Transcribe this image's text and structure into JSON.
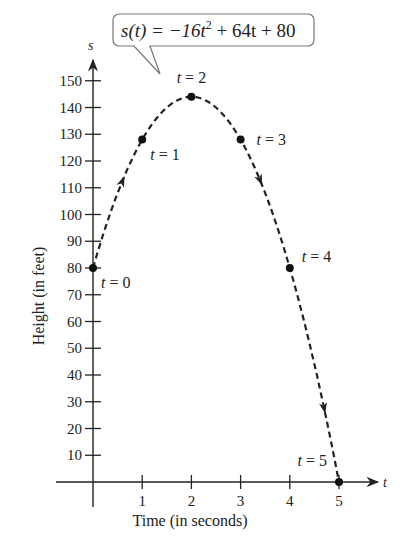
{
  "chart_data": {
    "type": "line",
    "title": "",
    "function_label": "s(t) = −16t² + 64t + 80",
    "xlabel": "Time (in seconds)",
    "ylabel": "Height (in feet)",
    "x_axis_var": "t",
    "y_axis_var": "s",
    "xlim": [
      0,
      5
    ],
    "ylim": [
      0,
      150
    ],
    "x_ticks": [
      1,
      2,
      3,
      4,
      5
    ],
    "y_ticks": [
      10,
      20,
      30,
      40,
      50,
      60,
      70,
      80,
      90,
      100,
      110,
      120,
      130,
      140,
      150
    ],
    "grid": false,
    "line_style": "dashed",
    "points": [
      {
        "t": 0,
        "s": 80,
        "label": "t = 0"
      },
      {
        "t": 1,
        "s": 128,
        "label": "t = 1"
      },
      {
        "t": 2,
        "s": 144,
        "label": "t = 2"
      },
      {
        "t": 3,
        "s": 128,
        "label": "t = 3"
      },
      {
        "t": 4,
        "s": 80,
        "label": "t = 4"
      },
      {
        "t": 5,
        "s": 0,
        "label": "t = 5"
      }
    ],
    "x": [
      0,
      1,
      2,
      3,
      4,
      5
    ],
    "series": [
      {
        "name": "s(t)",
        "values": [
          80,
          128,
          144,
          128,
          80,
          0
        ]
      }
    ],
    "direction_arrows_at_t": [
      0.6,
      3.4,
      4.7
    ]
  },
  "labels": {
    "equation_prefix": "s(t) = −16t",
    "equation_exp": "2",
    "equation_suffix": " + 64t + 80",
    "xlabel": "Time (in seconds)",
    "ylabel": "Height (in feet)",
    "x_var": "t",
    "y_var": "s"
  }
}
